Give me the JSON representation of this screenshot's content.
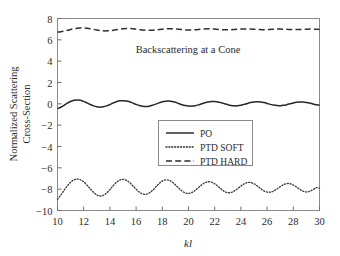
{
  "chart_data": {
    "type": "line",
    "title": "Backscattering at a Cone",
    "xlabel": "kl",
    "ylabel_line1": "Normalized Scattering",
    "ylabel_line2": "Cross-Section",
    "xlim": [
      10,
      30
    ],
    "ylim": [
      -10,
      8
    ],
    "grid": false,
    "legend_position": "center",
    "xticks": [
      10,
      12,
      14,
      16,
      18,
      20,
      22,
      24,
      26,
      28,
      30
    ],
    "xtick_labels": [
      "10",
      "12",
      "14",
      "16",
      "18",
      "20",
      "22",
      "24",
      "26",
      "28",
      "30"
    ],
    "yticks": [
      -10,
      -8,
      -6,
      -4,
      -2,
      0,
      2,
      4,
      6,
      8
    ],
    "ytick_labels": [
      "−10",
      "−8",
      "−6",
      "−4",
      "−2",
      "0",
      "2",
      "4",
      "6",
      "8"
    ],
    "series": [
      {
        "name": "PO",
        "style": "solid",
        "color": "#262626",
        "x": [
          10.0,
          10.25,
          10.5,
          10.75,
          11.0,
          11.25,
          11.5,
          11.75,
          12.0,
          12.25,
          12.5,
          12.75,
          13.0,
          13.25,
          13.5,
          13.75,
          14.0,
          14.25,
          14.5,
          14.75,
          15.0,
          15.25,
          15.5,
          15.75,
          16.0,
          16.25,
          16.5,
          16.75,
          17.0,
          17.25,
          17.5,
          17.75,
          18.0,
          18.25,
          18.5,
          18.75,
          19.0,
          19.25,
          19.5,
          19.75,
          20.0,
          20.25,
          20.5,
          20.75,
          21.0,
          21.25,
          21.5,
          21.75,
          22.0,
          22.25,
          22.5,
          22.75,
          23.0,
          23.25,
          23.5,
          23.75,
          24.0,
          24.25,
          24.5,
          24.75,
          25.0,
          25.25,
          25.5,
          25.75,
          26.0,
          26.25,
          26.5,
          26.75,
          27.0,
          27.25,
          27.5,
          27.75,
          28.0,
          28.25,
          28.5,
          28.75,
          29.0,
          29.25,
          29.5,
          29.75,
          30.0
        ],
        "y": [
          -0.45,
          -0.32,
          -0.14,
          0.06,
          0.22,
          0.33,
          0.36,
          0.33,
          0.23,
          0.09,
          -0.06,
          -0.19,
          -0.28,
          -0.31,
          -0.28,
          -0.19,
          -0.06,
          0.08,
          0.2,
          0.28,
          0.3,
          0.27,
          0.19,
          0.07,
          -0.05,
          -0.16,
          -0.23,
          -0.25,
          -0.22,
          -0.14,
          -0.03,
          0.09,
          0.19,
          0.25,
          0.26,
          0.22,
          0.14,
          0.03,
          -0.08,
          -0.16,
          -0.21,
          -0.21,
          -0.17,
          -0.1,
          0.0,
          0.1,
          0.18,
          0.22,
          0.22,
          0.18,
          0.1,
          0.01,
          -0.08,
          -0.15,
          -0.19,
          -0.18,
          -0.13,
          -0.05,
          0.04,
          0.12,
          0.18,
          0.2,
          0.18,
          0.12,
          0.04,
          -0.05,
          -0.12,
          -0.16,
          -0.17,
          -0.14,
          -0.08,
          0.0,
          0.08,
          0.14,
          0.17,
          0.17,
          0.13,
          0.07,
          -0.01,
          -0.08,
          -0.13
        ]
      },
      {
        "name": "PTD SOFT",
        "style": "dotted",
        "color": "#3d3d3d",
        "x": [
          10.0,
          10.25,
          10.5,
          10.75,
          11.0,
          11.25,
          11.5,
          11.75,
          12.0,
          12.25,
          12.5,
          12.75,
          13.0,
          13.25,
          13.5,
          13.75,
          14.0,
          14.25,
          14.5,
          14.75,
          15.0,
          15.25,
          15.5,
          15.75,
          16.0,
          16.25,
          16.5,
          16.75,
          17.0,
          17.25,
          17.5,
          17.75,
          18.0,
          18.25,
          18.5,
          18.75,
          19.0,
          19.25,
          19.5,
          19.75,
          20.0,
          20.25,
          20.5,
          20.75,
          21.0,
          21.25,
          21.5,
          21.75,
          22.0,
          22.25,
          22.5,
          22.75,
          23.0,
          23.25,
          23.5,
          23.75,
          24.0,
          24.25,
          24.5,
          24.75,
          25.0,
          25.25,
          25.5,
          25.75,
          26.0,
          26.25,
          26.5,
          26.75,
          27.0,
          27.25,
          27.5,
          27.75,
          28.0,
          28.25,
          28.5,
          28.75,
          29.0,
          29.25,
          29.5,
          29.75,
          30.0
        ],
        "y": [
          -8.95,
          -8.55,
          -8.1,
          -7.68,
          -7.35,
          -7.13,
          -7.05,
          -7.12,
          -7.32,
          -7.62,
          -7.97,
          -8.3,
          -8.54,
          -8.64,
          -8.58,
          -8.36,
          -8.04,
          -7.68,
          -7.36,
          -7.15,
          -7.08,
          -7.16,
          -7.38,
          -7.68,
          -8.0,
          -8.28,
          -8.45,
          -8.48,
          -8.36,
          -8.12,
          -7.8,
          -7.48,
          -7.24,
          -7.13,
          -7.16,
          -7.33,
          -7.6,
          -7.9,
          -8.17,
          -8.35,
          -8.4,
          -8.32,
          -8.12,
          -7.86,
          -7.6,
          -7.4,
          -7.31,
          -7.34,
          -7.5,
          -7.74,
          -8.0,
          -8.22,
          -8.33,
          -8.31,
          -8.17,
          -7.95,
          -7.7,
          -7.5,
          -7.38,
          -7.38,
          -7.5,
          -7.7,
          -7.94,
          -8.15,
          -8.27,
          -8.28,
          -8.17,
          -7.98,
          -7.76,
          -7.58,
          -7.48,
          -7.49,
          -7.61,
          -7.8,
          -8.02,
          -8.19,
          -8.26,
          -8.2,
          -8.05,
          -7.86,
          -7.9
        ]
      },
      {
        "name": "PTD HARD",
        "style": "dashed",
        "color": "#2e2e2e",
        "x": [
          10.0,
          10.25,
          10.5,
          10.75,
          11.0,
          11.25,
          11.5,
          11.75,
          12.0,
          12.25,
          12.5,
          12.75,
          13.0,
          13.25,
          13.5,
          13.75,
          14.0,
          14.25,
          14.5,
          14.75,
          15.0,
          15.25,
          15.5,
          15.75,
          16.0,
          16.25,
          16.5,
          16.75,
          17.0,
          17.25,
          17.5,
          17.75,
          18.0,
          18.25,
          18.5,
          18.75,
          19.0,
          19.25,
          19.5,
          19.75,
          20.0,
          20.25,
          20.5,
          20.75,
          21.0,
          21.25,
          21.5,
          21.75,
          22.0,
          22.25,
          22.5,
          22.75,
          23.0,
          23.25,
          23.5,
          23.75,
          24.0,
          24.25,
          24.5,
          24.75,
          25.0,
          25.25,
          25.5,
          25.75,
          26.0,
          26.25,
          26.5,
          26.75,
          27.0,
          27.25,
          27.5,
          27.75,
          28.0,
          28.25,
          28.5,
          28.75,
          29.0,
          29.25,
          29.5,
          29.75,
          30.0
        ],
        "y": [
          6.72,
          6.76,
          6.82,
          6.89,
          6.97,
          7.04,
          7.09,
          7.12,
          7.12,
          7.09,
          7.04,
          6.98,
          6.92,
          6.87,
          6.84,
          6.84,
          6.86,
          6.9,
          6.95,
          7.0,
          7.04,
          7.06,
          7.06,
          7.04,
          7.0,
          6.96,
          6.92,
          6.9,
          6.89,
          6.9,
          6.93,
          6.97,
          7.0,
          7.03,
          7.04,
          7.04,
          7.02,
          6.99,
          6.96,
          6.93,
          6.92,
          6.92,
          6.94,
          6.97,
          7.0,
          7.02,
          7.03,
          7.03,
          7.01,
          6.98,
          6.96,
          6.94,
          6.94,
          6.95,
          6.97,
          6.99,
          7.01,
          7.02,
          7.02,
          7.01,
          6.99,
          6.97,
          6.96,
          6.95,
          6.96,
          6.98,
          7.0,
          7.01,
          7.01,
          7.0,
          6.99,
          6.97,
          6.96,
          6.96,
          6.97,
          6.99,
          7.0,
          7.01,
          7.0,
          6.99,
          6.98
        ]
      }
    ]
  },
  "legend": {
    "items": [
      {
        "label": "PO",
        "style": "solid"
      },
      {
        "label": "PTD SOFT",
        "style": "dotted"
      },
      {
        "label": "PTD HARD",
        "style": "dashed"
      }
    ]
  }
}
